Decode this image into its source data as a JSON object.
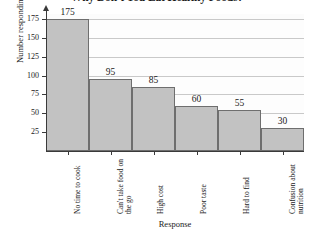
{
  "chart_data": {
    "type": "bar",
    "title": "Why Don't You Eat Healthy Foods?",
    "xlabel": "Response",
    "ylabel": "Number responding",
    "categories": [
      "No time to cook",
      "Can't take food on the go",
      "High cost",
      "Poor taste",
      "Hard to find",
      "Confusion about nutrition"
    ],
    "values": [
      175,
      95,
      85,
      60,
      55,
      30
    ],
    "value_labels": [
      "175",
      "95",
      "85",
      "60",
      "55",
      "30"
    ],
    "ylim": [
      0,
      180
    ],
    "yticks": [
      25,
      50,
      75,
      100,
      125,
      150,
      175
    ],
    "ytick_labels": [
      "25",
      "50",
      "75",
      "100",
      "125",
      "150",
      "175"
    ],
    "grid": "horizontal",
    "legend": "none",
    "bar_color": "#c2c2c2",
    "bar_border_color": "#6e6e6e",
    "gridline_color": "#c9c9c9",
    "axis_color": "#3a3a3a",
    "background_color": "#ffffff"
  }
}
